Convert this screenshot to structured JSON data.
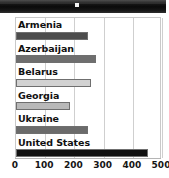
{
  "window": {
    "titlebar_label": "",
    "titlebar_color": "#0d0d0d",
    "marker_name": "titlebar-marker"
  },
  "chart_data": {
    "type": "bar",
    "orientation": "horizontal",
    "title": "",
    "xlabel": "",
    "ylabel": "",
    "categories": [
      "Armenia",
      "Azerbaijan",
      "Belarus",
      "Georgia",
      "Ukraine",
      "United States"
    ],
    "values": [
      247,
      273,
      257,
      184,
      247,
      453
    ],
    "bar_colors": [
      "#4d4d4d",
      "#6e6e6e",
      "#d2d2d2",
      "#b9b9b9",
      "#6b6b6b",
      "#111111"
    ],
    "xlim": [
      0,
      500
    ],
    "xticks": [
      0,
      100,
      200,
      300,
      400,
      500
    ],
    "xtick_labels": [
      "0",
      "100",
      "200",
      "300",
      "400",
      "500"
    ],
    "grid": true,
    "grid_axis": "x",
    "legend": false,
    "label_position": "above-bar"
  }
}
